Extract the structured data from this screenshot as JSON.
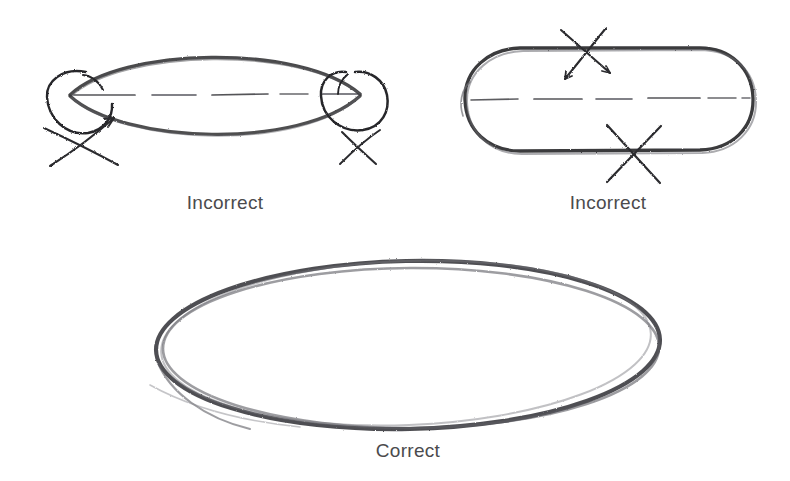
{
  "page": {
    "background_color": "#ffffff",
    "width": 790,
    "height": 481,
    "medium": "pencil sketch"
  },
  "style": {
    "ink_color": "#3a3a3c",
    "ink_color_light": "#8a8a8e",
    "caption_color": "#4b4b4d",
    "centerline_color": "#2f2f31"
  },
  "figures": [
    {
      "id": "incorrect-pointed",
      "caption": "Incorrect",
      "caption_x": 225,
      "caption_y": 192,
      "shape": "pointed lens / football with sharp vertices",
      "error": "ends come to a point instead of curving",
      "center": {
        "x": 216,
        "y": 96
      },
      "radius_x": 154,
      "radius_y": 48,
      "annotations": [
        {
          "type": "circle-highlight",
          "x": 73,
          "y": 95,
          "r": 26,
          "marks": "left pointed vertex"
        },
        {
          "type": "circle-highlight",
          "x": 358,
          "y": 95,
          "r": 26,
          "marks": "right pointed vertex"
        },
        {
          "type": "x-mark",
          "x": 71,
          "y": 143,
          "size": 27,
          "has_arrow": true
        },
        {
          "type": "x-mark",
          "x": 358,
          "y": 146,
          "size": 24,
          "has_arrow": false
        }
      ],
      "centerline": {
        "style": "dashed",
        "x1": 70,
        "x2": 362,
        "y": 95
      }
    },
    {
      "id": "incorrect-stadium",
      "caption": "Incorrect",
      "caption_x": 608,
      "caption_y": 192,
      "shape": "stadium / rounded rectangle with flattened top and bottom",
      "error": "straight flat sides instead of continuous curve",
      "center": {
        "x": 608,
        "y": 99
      },
      "radius_x": 146,
      "radius_y": 55,
      "annotations": [
        {
          "type": "x-mark",
          "x": 586,
          "y": 53,
          "size": 32,
          "marks": "flat top edge"
        },
        {
          "type": "x-mark",
          "x": 633,
          "y": 152,
          "size": 32,
          "marks": "flat bottom edge"
        }
      ],
      "centerline": {
        "style": "dashed",
        "x1": 470,
        "x2": 748,
        "y": 99
      }
    },
    {
      "id": "correct-ellipse",
      "caption": "Correct",
      "caption_x": 408,
      "caption_y": 440,
      "shape": "smooth continuous ellipse",
      "note": "drawn with several light overlapping passes",
      "center": {
        "x": 408,
        "y": 345
      },
      "radius_x": 253,
      "radius_y": 85,
      "stroke_passes": 3,
      "annotations": [],
      "centerline": null
    }
  ],
  "captions": {
    "incorrect_left": "Incorrect",
    "incorrect_right": "Incorrect",
    "correct": "Correct"
  }
}
